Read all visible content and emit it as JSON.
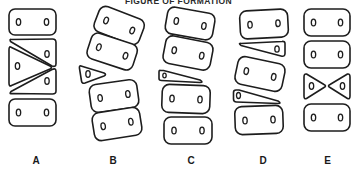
{
  "figure": {
    "title": "FIGURE OF FORMATION",
    "background_color": "#ffffff",
    "stroke_color": "#1d1d1a",
    "shape_fill": "#ffffff",
    "width": 357,
    "height": 170
  },
  "answer_options": [
    {
      "label": "A",
      "name": "option-a",
      "x": 0,
      "width": 72,
      "description": "Vertical stack: rectangle, wedge, right-pointing triangle with two wedges, rectangle",
      "pieces": [
        {
          "name": "rounded-rectangle-top",
          "type": "rounded-rect",
          "pegs": 2
        },
        {
          "name": "wedge-upper-right",
          "type": "wedge",
          "pegs": 1
        },
        {
          "name": "triangle-pointing-right",
          "type": "triangle",
          "pegs": 1
        },
        {
          "name": "wedge-lower-right",
          "type": "wedge",
          "pegs": 1
        },
        {
          "name": "rounded-rectangle-bottom",
          "type": "rounded-rect",
          "pegs": 2
        }
      ]
    },
    {
      "label": "B",
      "name": "option-b",
      "x": 72,
      "width": 82,
      "description": "Tilted stack of four rounded rectangles with a small triangle wedged at the left middle",
      "pieces": [
        {
          "name": "rounded-rectangle-tilted-1",
          "type": "rounded-rect",
          "pegs": 2
        },
        {
          "name": "rounded-rectangle-tilted-2",
          "type": "rounded-rect",
          "pegs": 2
        },
        {
          "name": "small-triangle-left",
          "type": "triangle",
          "pegs": 1
        },
        {
          "name": "rounded-rectangle-tilted-3",
          "type": "rounded-rect",
          "pegs": 2
        },
        {
          "name": "rounded-rectangle-tilted-4",
          "type": "rounded-rect",
          "pegs": 2
        }
      ]
    },
    {
      "label": "C",
      "name": "option-c",
      "x": 154,
      "width": 74,
      "description": "Tilted stack of four rounded rectangles with a thin sliver wedge in the middle",
      "pieces": [
        {
          "name": "rounded-rectangle-tilted-1",
          "type": "rounded-rect",
          "pegs": 2
        },
        {
          "name": "rounded-rectangle-tilted-2",
          "type": "rounded-rect",
          "pegs": 2
        },
        {
          "name": "thin-sliver-wedge",
          "type": "sliver",
          "pegs": 1
        },
        {
          "name": "rounded-rectangle-3",
          "type": "rounded-rect",
          "pegs": 2
        },
        {
          "name": "rounded-rectangle-4",
          "type": "rounded-rect",
          "pegs": 2
        }
      ]
    },
    {
      "label": "D",
      "name": "option-d",
      "x": 228,
      "width": 70,
      "description": "Rectangle, thin wedge, tilted rectangle, thin wedge, rectangle",
      "pieces": [
        {
          "name": "rounded-rectangle-top",
          "type": "rounded-rect",
          "pegs": 2
        },
        {
          "name": "thin-wedge-upper",
          "type": "sliver",
          "pegs": 1
        },
        {
          "name": "rounded-rectangle-tilted",
          "type": "rounded-rect",
          "pegs": 2
        },
        {
          "name": "thin-wedge-lower",
          "type": "sliver",
          "pegs": 1
        },
        {
          "name": "rounded-rectangle-bottom",
          "type": "rounded-rect",
          "pegs": 2
        }
      ]
    },
    {
      "label": "E",
      "name": "option-e",
      "x": 298,
      "width": 59,
      "description": "Two rectangles, a facing pair of triangles forming a bowtie, then a rectangle",
      "pieces": [
        {
          "name": "rounded-rectangle-1",
          "type": "rounded-rect",
          "pegs": 2
        },
        {
          "name": "rounded-rectangle-2",
          "type": "rounded-rect",
          "pegs": 2
        },
        {
          "name": "triangle-pointing-right",
          "type": "triangle",
          "pegs": 1
        },
        {
          "name": "triangle-pointing-left",
          "type": "triangle",
          "pegs": 1
        },
        {
          "name": "rounded-rectangle-3",
          "type": "rounded-rect",
          "pegs": 2
        }
      ]
    }
  ]
}
